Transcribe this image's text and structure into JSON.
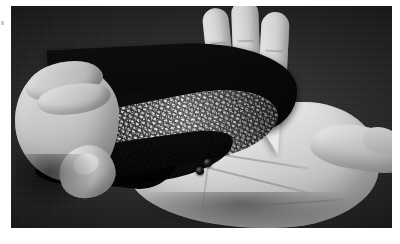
{
  "page": {
    "background_color": "#ffffff",
    "canvas_width": 400,
    "canvas_height": 244
  },
  "marks": {
    "left_registration_tick": {
      "label": "",
      "color": "#b9b9b9",
      "x": 1,
      "y": 21
    }
  },
  "photo": {
    "caption": "",
    "alt_text": "Grayscale photograph: a hand peels back a flexible black-coated sheet with a granular textured cross-section over an open palm holding two small dark beads",
    "type": "photograph",
    "color_mode": "grayscale",
    "frame": {
      "x": 11,
      "y": 6,
      "width": 381,
      "height": 222
    },
    "backdrop": {
      "name": "dark-textile-backdrop",
      "color": "#2b2a29",
      "description": "dark charcoal woven cloth"
    },
    "subjects": [
      {
        "name": "open-right-hand",
        "description": "open palm facing camera, three fingers extended upward, thumb sweeping to the right",
        "skin_highlight": "#f2f0ee",
        "skin_shadow": "#b3ada6"
      },
      {
        "name": "left-pinching-hand",
        "description": "second hand at left gripping and lifting the edge of the sheet",
        "skin_highlight": "#eeebe7",
        "skin_shadow": "#a8a29b"
      },
      {
        "name": "material-sample",
        "description": "curved flexible strip; glossy black top face with a pale speckled granular cross-section band exposed along the lower edge",
        "top_face_color": "#050505",
        "texture_band_base": "#e2ded8",
        "texture_band_speckle": "#1b1a19"
      },
      {
        "name": "white-wedge-tip",
        "description": "white triangular folded tip of the sheet resting against the palm",
        "color": "#f3f1ee"
      },
      {
        "name": "beads",
        "description": "two small dark spherical beads resting on the palm",
        "count": 2,
        "color": "#040404",
        "positions": [
          {
            "x": 193,
            "y": 153,
            "size": 8
          },
          {
            "x": 185,
            "y": 161,
            "size": 8
          }
        ]
      }
    ]
  }
}
